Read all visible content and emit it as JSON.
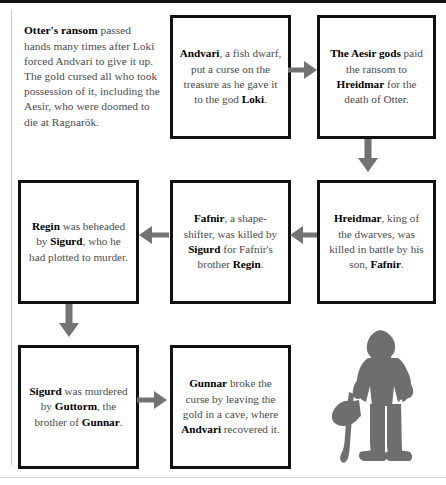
{
  "intro": {
    "lead": "Otter's ransom",
    "body": " passed hands many times after Loki forced Andvari to give it up. The gold cursed all who took possession of it, including the Aesir, who were doomed to die at Ragnarök."
  },
  "boxes": [
    {
      "id": "andvari",
      "segments": [
        {
          "text": "Andvari",
          "bold": true
        },
        {
          "text": ", a fish dwarf, put a curse on the treasure as he gave it to the god ",
          "bold": false
        },
        {
          "text": "Loki",
          "bold": true
        },
        {
          "text": ".",
          "bold": false
        }
      ]
    },
    {
      "id": "aesir",
      "segments": [
        {
          "text": "The Aesir gods",
          "bold": true
        },
        {
          "text": " paid the ransom to ",
          "bold": false
        },
        {
          "text": "Hreidmar",
          "bold": true
        },
        {
          "text": " for the death of Otter.",
          "bold": false
        }
      ]
    },
    {
      "id": "hreidmar",
      "segments": [
        {
          "text": "Hreidmar",
          "bold": true
        },
        {
          "text": ", king of the dwarves, was killed in battle by his son, ",
          "bold": false
        },
        {
          "text": "Fafnir",
          "bold": true
        },
        {
          "text": ".",
          "bold": false
        }
      ]
    },
    {
      "id": "fafnir",
      "segments": [
        {
          "text": "Fafnir",
          "bold": true
        },
        {
          "text": ", a shape-shifter, was killed by ",
          "bold": false
        },
        {
          "text": "Sigurd",
          "bold": true
        },
        {
          "text": " for Fafnir's brother ",
          "bold": false
        },
        {
          "text": "Regin",
          "bold": true
        },
        {
          "text": ".",
          "bold": false
        }
      ]
    },
    {
      "id": "regin",
      "segments": [
        {
          "text": "Regin",
          "bold": true
        },
        {
          "text": " was beheaded by ",
          "bold": false
        },
        {
          "text": "Sigurd",
          "bold": true
        },
        {
          "text": ", who he had plotted to murder.",
          "bold": false
        }
      ]
    },
    {
      "id": "sigurd",
      "segments": [
        {
          "text": "Sigurd",
          "bold": true
        },
        {
          "text": " was murdered by ",
          "bold": false
        },
        {
          "text": "Guttorm",
          "bold": true
        },
        {
          "text": ", the brother of ",
          "bold": false
        },
        {
          "text": "Gunnar",
          "bold": true
        },
        {
          "text": ".",
          "bold": false
        }
      ]
    },
    {
      "id": "gunnar",
      "segments": [
        {
          "text": "Gunnar",
          "bold": true
        },
        {
          "text": " broke the curse by leaving the gold in a cave, where ",
          "bold": false
        },
        {
          "text": "Andvari",
          "bold": true
        },
        {
          "text": " recovered it.",
          "bold": false
        }
      ]
    }
  ],
  "arrows": [
    {
      "id": "andvari-aesir",
      "direction": "right"
    },
    {
      "id": "aesir-hreidmar",
      "direction": "down"
    },
    {
      "id": "hreidmar-fafnir",
      "direction": "left"
    },
    {
      "id": "fafnir-regin",
      "direction": "left"
    },
    {
      "id": "regin-sigurd",
      "direction": "down"
    },
    {
      "id": "sigurd-gunnar",
      "direction": "right"
    }
  ],
  "illustration": {
    "name": "dwarf-with-axe-silhouette"
  },
  "colors": {
    "box_border": "#111111",
    "body_text": "#4c4c4c",
    "emphasis_text": "#000000",
    "arrow": "#737373",
    "illustration": "#6e6e6e",
    "rule": "#111111",
    "divider": "#c9c9c9",
    "background": "#ffffff"
  }
}
